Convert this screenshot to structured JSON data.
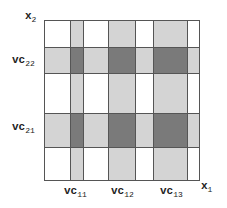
{
  "diagram": {
    "axes": {
      "x_label": "x",
      "x_sub": "1",
      "y_label": "x",
      "y_sub": "2"
    },
    "x_intervals": [
      {
        "label": "vc",
        "sub": "11"
      },
      {
        "label": "vc",
        "sub": "12"
      },
      {
        "label": "vc",
        "sub": "13"
      }
    ],
    "y_intervals": [
      {
        "label": "vc",
        "sub": "21"
      },
      {
        "label": "vc",
        "sub": "22"
      }
    ],
    "colors": {
      "single_coverage": "#d4d4d4",
      "double_coverage": "#7a7a7a",
      "grid_line": "#555555",
      "background": "#ffffff"
    }
  }
}
